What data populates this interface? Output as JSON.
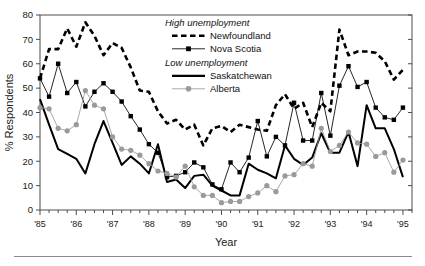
{
  "figure": {
    "axis_y_label": "% Respondents",
    "axis_x_label": "Year",
    "legend": {
      "group1_title": "High unemployment",
      "group2_title": "Low unemployment",
      "items": [
        {
          "name": "Newfoundland",
          "style": "dashed",
          "color": "#000000"
        },
        {
          "name": "Nova Scotia",
          "style": "line-marker-square",
          "color": "#000000"
        },
        {
          "name": "Saskatchewan",
          "style": "solid-thick",
          "color": "#000000"
        },
        {
          "name": "Alberta",
          "style": "line-marker-circle",
          "color": "#9a9a9a"
        }
      ]
    }
  },
  "chart_data": {
    "type": "line",
    "title": "",
    "xlabel": "Year",
    "ylabel": "% Respondents",
    "ylim": [
      0,
      80
    ],
    "yticks": [
      0,
      10,
      20,
      30,
      40,
      50,
      60,
      70,
      80
    ],
    "xtick_labels": [
      "'85",
      "'86",
      "'87",
      "'88",
      "'89",
      "'90",
      "'91",
      "'92",
      "'93",
      "'94",
      "'95"
    ],
    "xtick_values": [
      1985,
      1986,
      1987,
      1988,
      1989,
      1990,
      1991,
      1992,
      1993,
      1994,
      1995
    ],
    "xlim": [
      1985.0,
      1995.25
    ],
    "x_minor_tick_interval": 0.25,
    "grid": false,
    "legend_position": "inside-top-center",
    "x": [
      1985.0,
      1985.25,
      1985.5,
      1985.75,
      1986.0,
      1986.25,
      1986.5,
      1986.75,
      1987.0,
      1987.25,
      1987.5,
      1987.75,
      1988.0,
      1988.25,
      1988.5,
      1988.75,
      1989.0,
      1989.25,
      1989.5,
      1989.75,
      1990.0,
      1990.25,
      1990.5,
      1990.75,
      1991.0,
      1991.25,
      1991.5,
      1991.75,
      1992.0,
      1992.25,
      1992.5,
      1992.75,
      1993.0,
      1993.25,
      1993.5,
      1993.75,
      1994.0,
      1994.25,
      1994.5,
      1994.75,
      1995.0
    ],
    "series": [
      {
        "name": "Newfoundland",
        "group": "High unemployment",
        "color": "#000000",
        "style": "dashed",
        "values": [
          54.0,
          66.0,
          66.0,
          74.5,
          67.0,
          77.0,
          71.5,
          63.5,
          68.5,
          66.5,
          58.5,
          49.0,
          48.5,
          40.5,
          35.5,
          37.0,
          33.0,
          35.0,
          26.5,
          33.5,
          34.5,
          32.0,
          35.0,
          34.0,
          33.0,
          32.5,
          43.0,
          47.5,
          41.5,
          44.0,
          34.0,
          44.0,
          40.5,
          74.0,
          63.5,
          65.0,
          65.0,
          64.5,
          61.0,
          53.5,
          57.5
        ]
      },
      {
        "name": "Nova Scotia",
        "group": "High unemployment",
        "color": "#000000",
        "style": "line-marker-square",
        "values": [
          54.0,
          46.5,
          60.0,
          48.0,
          52.5,
          42.5,
          48.5,
          52.0,
          48.5,
          44.5,
          38.5,
          33.0,
          27.0,
          23.5,
          13.5,
          14.0,
          15.5,
          19.5,
          17.5,
          10.5,
          8.5,
          19.5,
          15.5,
          21.5,
          36.5,
          22.0,
          30.0,
          26.5,
          44.0,
          28.5,
          28.5,
          48.0,
          30.5,
          51.0,
          59.0,
          50.5,
          52.5,
          42.0,
          38.0,
          37.0,
          42.0
        ]
      },
      {
        "name": "Saskatchewan",
        "group": "Low unemployment",
        "color": "#000000",
        "style": "solid-thick",
        "values": [
          45.5,
          35.0,
          25.0,
          23.0,
          21.0,
          15.0,
          27.0,
          36.5,
          27.5,
          18.5,
          22.0,
          19.0,
          15.0,
          27.0,
          11.5,
          12.5,
          9.0,
          14.0,
          14.5,
          10.0,
          8.0,
          6.0,
          6.0,
          19.0,
          16.5,
          15.0,
          13.0,
          26.5,
          21.0,
          18.5,
          21.5,
          31.5,
          23.5,
          23.5,
          32.0,
          18.0,
          43.0,
          33.5,
          33.5,
          25.0,
          13.5
        ]
      },
      {
        "name": "Alberta",
        "group": "Low unemployment",
        "color": "#9a9a9a",
        "style": "line-marker-circle",
        "values": [
          42.0,
          41.5,
          33.5,
          32.5,
          35.0,
          49.0,
          43.0,
          41.5,
          30.0,
          25.0,
          24.5,
          22.5,
          19.0,
          16.0,
          15.0,
          13.5,
          18.0,
          9.5,
          6.0,
          6.0,
          3.0,
          3.5,
          3.5,
          5.5,
          7.0,
          10.0,
          7.5,
          14.0,
          14.5,
          19.0,
          18.0,
          33.5,
          24.0,
          26.5,
          32.0,
          27.5,
          27.0,
          22.0,
          23.5,
          15.5,
          20.5
        ]
      }
    ]
  }
}
